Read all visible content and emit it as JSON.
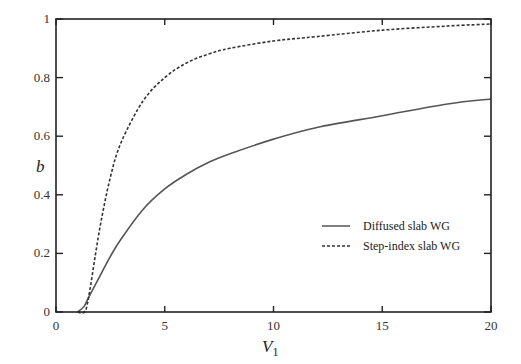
{
  "chart_data": {
    "type": "line",
    "title": "",
    "xlabel": "V1",
    "ylabel": "b",
    "xlim": [
      0,
      20
    ],
    "ylim": [
      0,
      1
    ],
    "xticks": [
      "0",
      "5",
      "10",
      "15",
      "20"
    ],
    "yticks": [
      "0",
      "0.2",
      "0.4",
      "0.6",
      "0.8",
      "1"
    ],
    "grid": false,
    "legend_position": "lower right",
    "x": [
      1.0,
      1.3,
      1.5,
      2,
      2.5,
      3,
      4,
      5,
      6,
      7,
      8,
      10,
      12,
      15,
      18,
      20
    ],
    "series": [
      {
        "name": "Diffused slab WG",
        "style": "solid",
        "values": [
          0.0,
          0.02,
          0.05,
          0.12,
          0.19,
          0.25,
          0.35,
          0.42,
          0.47,
          0.51,
          0.54,
          0.59,
          0.63,
          0.67,
          0.71,
          0.727
        ]
      },
      {
        "name": "Step-index slab WG",
        "style": "dashed",
        "values": [
          0.0,
          0.0,
          0.05,
          0.28,
          0.46,
          0.58,
          0.72,
          0.8,
          0.85,
          0.88,
          0.9,
          0.925,
          0.94,
          0.962,
          0.976,
          0.983
        ]
      }
    ]
  },
  "axes": {
    "xlabel_main": "V",
    "xlabel_sub": "1",
    "ylabel": "b"
  },
  "legend": [
    {
      "label": "Diffused slab WG",
      "style": "solid"
    },
    {
      "label": "Step-index slab WG",
      "style": "dashed"
    }
  ]
}
